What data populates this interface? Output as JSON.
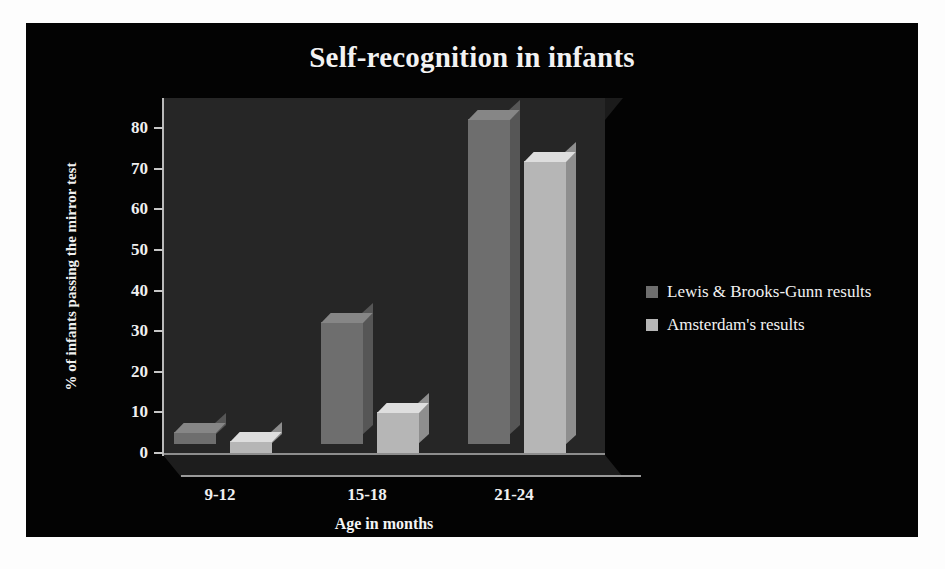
{
  "slide": {
    "background_color": "#030303",
    "text_color": "#f2f2f2"
  },
  "chart_data": {
    "type": "bar",
    "title": "Self-recognition in infants",
    "xlabel": "Age in months",
    "ylabel": "% of infants passing the mirror test",
    "categories": [
      "9-12",
      "15-18",
      "21-24"
    ],
    "ylim": [
      0,
      80
    ],
    "yticks": [
      0,
      10,
      20,
      30,
      40,
      50,
      60,
      70,
      80
    ],
    "grid": false,
    "legend_position": "right",
    "series": [
      {
        "name": "Lewis & Brooks-Gunn results",
        "color": "#6e6e6e",
        "values": [
          3,
          30,
          80
        ]
      },
      {
        "name": "Amsterdam's results",
        "color": "#b6b6b6",
        "values": [
          3,
          10,
          72
        ]
      }
    ]
  }
}
